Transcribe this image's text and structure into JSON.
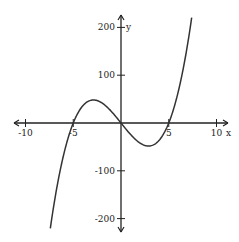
{
  "chart_data": {
    "type": "line",
    "title": "",
    "function": "y = x^3 - 25x",
    "xlabel": "x",
    "ylabel": "y",
    "xlim": [
      -11,
      11
    ],
    "ylim": [
      -230,
      230
    ],
    "grid": false,
    "x_ticks": [
      -10,
      -5,
      5,
      10
    ],
    "x_tick_labels": [
      "-10",
      "-5",
      "5",
      "10"
    ],
    "y_ticks": [
      200,
      100,
      -100,
      -200
    ],
    "y_tick_labels": [
      "200",
      "100",
      "-100",
      "-200"
    ],
    "domain_plotted": [
      -7.4,
      7.4
    ],
    "key_points": [
      {
        "label": "root",
        "x": -5,
        "y": 0
      },
      {
        "label": "root",
        "x": 0,
        "y": 0
      },
      {
        "label": "root",
        "x": 5,
        "y": 0
      },
      {
        "label": "local max",
        "x": -2.89,
        "y": 48.1
      },
      {
        "label": "local min",
        "x": 2.89,
        "y": -48.1
      }
    ],
    "series": [
      {
        "name": "y = x^3 - 25x",
        "x": [
          -7.4,
          -7,
          -6,
          -5,
          -4,
          -3,
          -2.89,
          -2,
          -1,
          0,
          1,
          2,
          2.89,
          3,
          4,
          5,
          6,
          7,
          7.4
        ],
        "values": [
          -220.2,
          -168,
          -66,
          0,
          36,
          48,
          48.1,
          42,
          24,
          0,
          -24,
          -42,
          -48.1,
          -48,
          -36,
          0,
          66,
          168,
          220.2
        ]
      }
    ]
  }
}
